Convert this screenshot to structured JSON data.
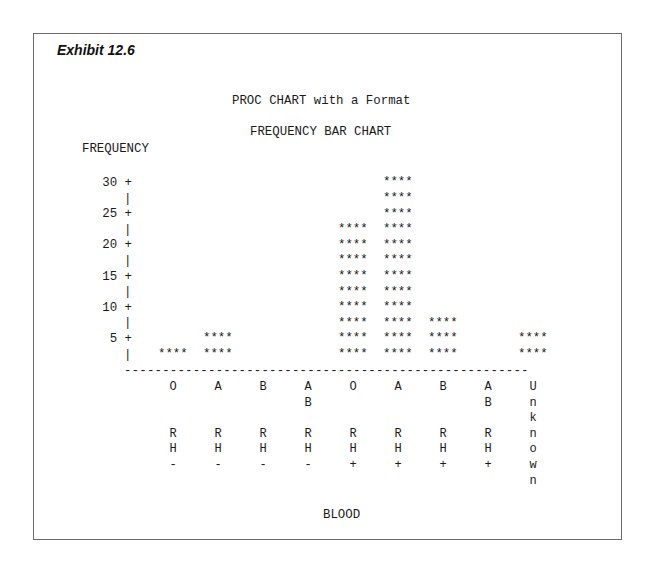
{
  "exhibit_label": "Exhibit 12.6",
  "title": "PROC CHART with a Format",
  "subtitle": "FREQUENCY BAR CHART",
  "ylabel": "FREQUENCY",
  "xlabel": "BLOOD",
  "bar_symbol": "****",
  "y_ticks": [
    {
      "label": "30 +",
      "value": 30
    },
    {
      "label": "25 +",
      "value": 25
    },
    {
      "label": "20 +",
      "value": 20
    },
    {
      "label": "15 +",
      "value": 15
    },
    {
      "label": "10 +",
      "value": 10
    },
    {
      "label": "5 +",
      "value": 5
    }
  ],
  "baseline": "-----------------------------------------------------",
  "categories": [
    {
      "lines": [
        "O",
        "",
        "",
        "R",
        "H",
        "-"
      ]
    },
    {
      "lines": [
        "A",
        "",
        "",
        "R",
        "H",
        "-"
      ]
    },
    {
      "lines": [
        "B",
        "",
        "",
        "R",
        "H",
        "-"
      ]
    },
    {
      "lines": [
        "A",
        "B",
        "",
        "R",
        "H",
        "-"
      ]
    },
    {
      "lines": [
        "O",
        "",
        "",
        "R",
        "H",
        "+"
      ]
    },
    {
      "lines": [
        "A",
        "",
        "",
        "R",
        "H",
        "+"
      ]
    },
    {
      "lines": [
        "B",
        "",
        "",
        "R",
        "H",
        "+"
      ]
    },
    {
      "lines": [
        "A",
        "B",
        "",
        "R",
        "H",
        "+"
      ]
    },
    {
      "lines": [
        "U",
        "n",
        "k",
        "n",
        "o",
        "w",
        "n"
      ]
    }
  ],
  "chart_data": {
    "type": "bar",
    "orientation": "vertical",
    "title": "PROC CHART with a Format",
    "subtitle": "FREQUENCY BAR CHART",
    "xlabel": "BLOOD",
    "ylabel": "FREQUENCY",
    "categories": [
      "O RH-",
      "A RH-",
      "B RH-",
      "AB RH-",
      "O RH+",
      "A RH+",
      "B RH+",
      "AB RH+",
      "Unknown"
    ],
    "values": [
      2.5,
      5,
      0,
      0,
      22.5,
      30,
      7.5,
      0,
      5
    ],
    "bar_rows": [
      1,
      2,
      0,
      0,
      9,
      12,
      3,
      0,
      2
    ],
    "row_unit": 2.5,
    "y_ticks": [
      5,
      10,
      15,
      20,
      25,
      30
    ],
    "ylim": [
      0,
      30
    ],
    "grid": false,
    "legend": "none",
    "style": "ASCII text chart, bars drawn with ****"
  }
}
